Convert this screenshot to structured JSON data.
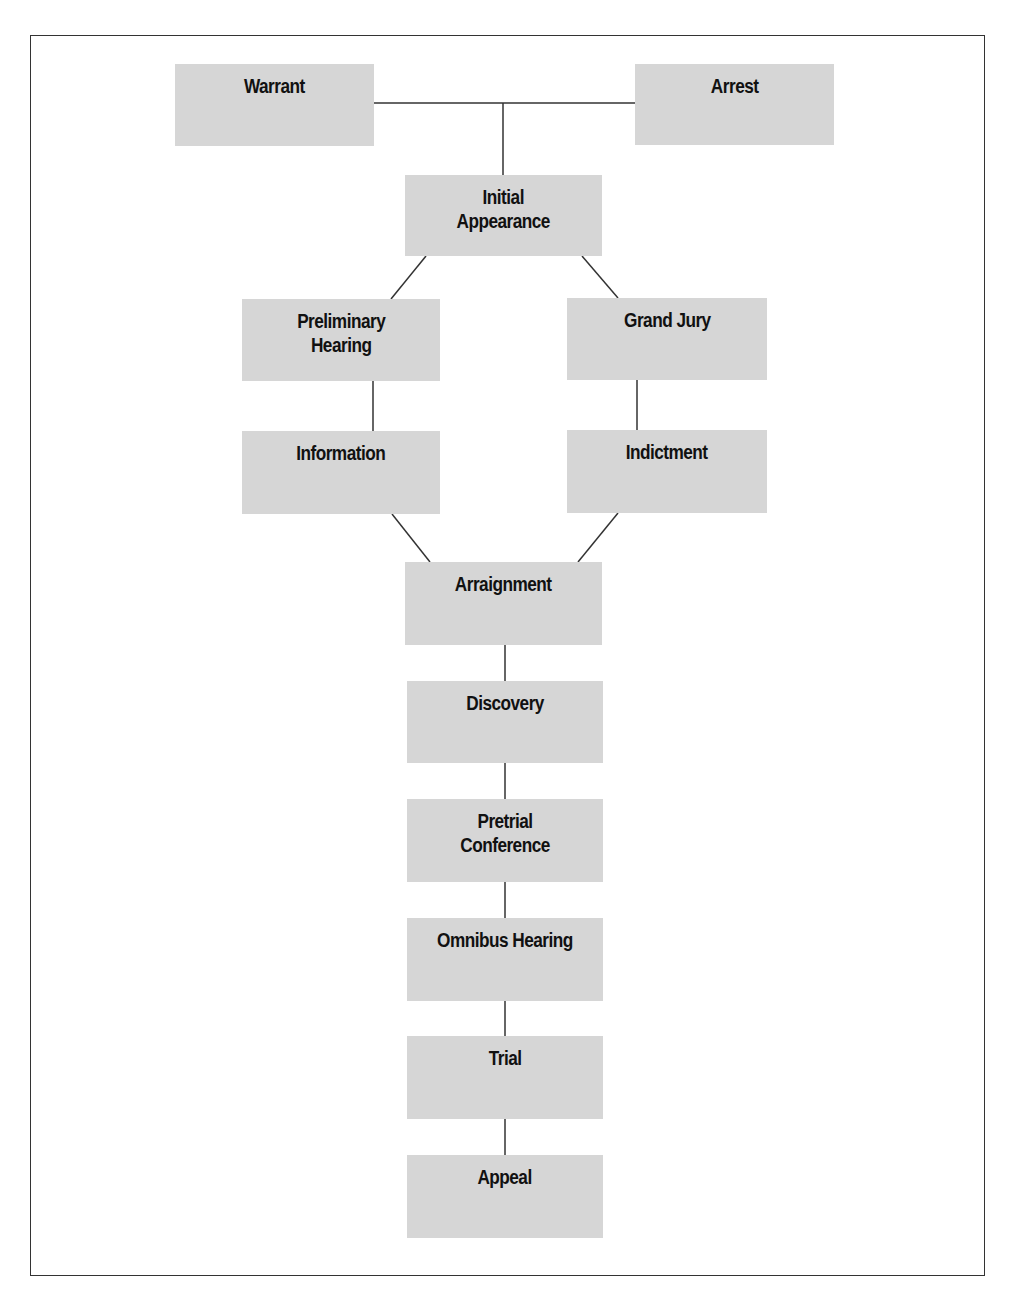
{
  "diagram": {
    "type": "flowchart",
    "colors": {
      "box_fill": "#d6d6d6",
      "text": "#111111",
      "line": "#333333",
      "frame": "#333333",
      "background": "#ffffff"
    },
    "nodes": {
      "warrant": {
        "label": "Warrant",
        "x": 175,
        "y": 64,
        "w": 199,
        "h": 82
      },
      "arrest": {
        "label": "Arrest",
        "x": 635,
        "y": 64,
        "w": 199,
        "h": 81
      },
      "initial_appearance": {
        "label": "Initial\nAppearance",
        "x": 405,
        "y": 175,
        "w": 197,
        "h": 81
      },
      "preliminary_hearing": {
        "label": "Preliminary\nHearing",
        "x": 242,
        "y": 299,
        "w": 198,
        "h": 82
      },
      "grand_jury": {
        "label": "Grand Jury",
        "x": 567,
        "y": 298,
        "w": 200,
        "h": 82
      },
      "information": {
        "label": "Information",
        "x": 242,
        "y": 431,
        "w": 198,
        "h": 83
      },
      "indictment": {
        "label": "Indictment",
        "x": 567,
        "y": 430,
        "w": 200,
        "h": 83
      },
      "arraignment": {
        "label": "Arraignment",
        "x": 405,
        "y": 562,
        "w": 197,
        "h": 83
      },
      "discovery": {
        "label": "Discovery",
        "x": 407,
        "y": 681,
        "w": 196,
        "h": 82
      },
      "pretrial_conference": {
        "label": "Pretrial\nConference",
        "x": 407,
        "y": 799,
        "w": 196,
        "h": 83
      },
      "omnibus_hearing": {
        "label": "Omnibus Hearing",
        "x": 407,
        "y": 918,
        "w": 196,
        "h": 83
      },
      "trial": {
        "label": "Trial",
        "x": 407,
        "y": 1036,
        "w": 196,
        "h": 83
      },
      "appeal": {
        "label": "Appeal",
        "x": 407,
        "y": 1155,
        "w": 196,
        "h": 83
      }
    },
    "edges": [
      {
        "from": "warrant",
        "to": "initial_appearance"
      },
      {
        "from": "arrest",
        "to": "initial_appearance"
      },
      {
        "from": "initial_appearance",
        "to": "preliminary_hearing"
      },
      {
        "from": "initial_appearance",
        "to": "grand_jury"
      },
      {
        "from": "preliminary_hearing",
        "to": "information"
      },
      {
        "from": "grand_jury",
        "to": "indictment"
      },
      {
        "from": "information",
        "to": "arraignment"
      },
      {
        "from": "indictment",
        "to": "arraignment"
      },
      {
        "from": "arraignment",
        "to": "discovery"
      },
      {
        "from": "discovery",
        "to": "pretrial_conference"
      },
      {
        "from": "pretrial_conference",
        "to": "omnibus_hearing"
      },
      {
        "from": "omnibus_hearing",
        "to": "trial"
      },
      {
        "from": "trial",
        "to": "appeal"
      }
    ]
  }
}
